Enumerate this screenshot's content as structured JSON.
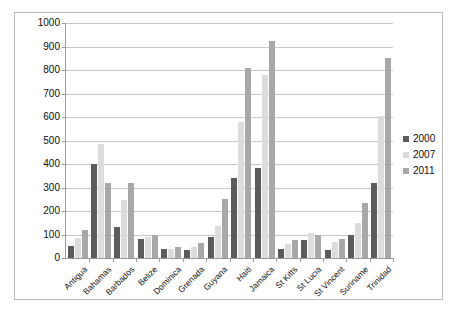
{
  "chart_data": {
    "type": "bar",
    "title": "",
    "subtitle": "",
    "xlabel": "",
    "ylabel": "",
    "ylim": [
      0,
      1000
    ],
    "ytick_step": 100,
    "yticks": [
      "0",
      "100",
      "200",
      "300",
      "400",
      "500",
      "600",
      "700",
      "800",
      "900",
      "1000"
    ],
    "grid": true,
    "legend_position": "right",
    "categories": [
      "Antigua",
      "Bahamas",
      "Barbados",
      "Belize",
      "Dominica",
      "Grenada",
      "Guyana",
      "Haiti",
      "Jamaica",
      "St Kitts",
      "St Lucia",
      "St Vincent",
      "Suriname",
      "Trinidad"
    ],
    "series": [
      {
        "name": "2000",
        "color": "#5b5b5b",
        "values": [
          50,
          400,
          130,
          80,
          40,
          35,
          90,
          340,
          385,
          40,
          75,
          35,
          100,
          320
        ]
      },
      {
        "name": "2007",
        "color": "#dcdcdc",
        "values": [
          85,
          485,
          245,
          90,
          40,
          45,
          135,
          580,
          780,
          60,
          105,
          70,
          150,
          605
        ]
      },
      {
        "name": "2011",
        "color": "#a8a8a8",
        "values": [
          120,
          320,
          320,
          100,
          45,
          65,
          250,
          810,
          925,
          75,
          100,
          80,
          235,
          850
        ]
      }
    ]
  },
  "legend": {
    "entries": [
      {
        "label": "2000"
      },
      {
        "label": "2007"
      },
      {
        "label": "2011"
      }
    ]
  }
}
